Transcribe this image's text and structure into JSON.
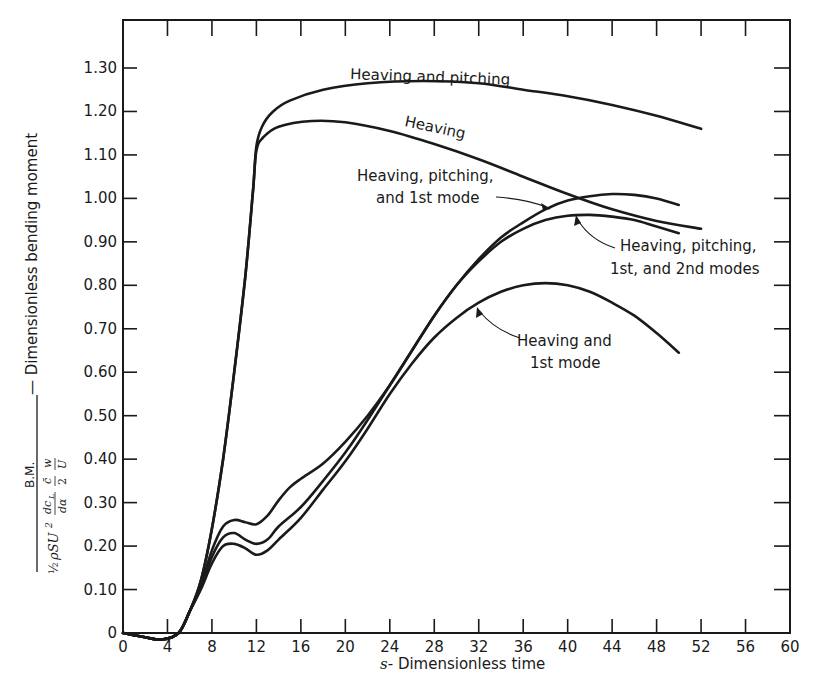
{
  "chart_data": {
    "type": "line",
    "title": "",
    "xlabel": "s - Dimensionless time",
    "xlabel_italic_prefix": "s",
    "xlabel_rest": "- Dimensionless time",
    "ylabel": "B.M. / (1/2 ρSU² (dc_L/dα) (c̄/2) (w/U)) — Dimensionless bending moment",
    "ylabel_parts": {
      "numerator": "B.M.",
      "denominator": "½ ρSU² (dcL/dα) (c̄/2) (w/U)",
      "suffix": "— Dimensionless bending moment"
    },
    "xlim": [
      0,
      60
    ],
    "ylim": [
      0,
      1.3
    ],
    "x_ticks": [
      "0",
      "4",
      "8",
      "12",
      "16",
      "20",
      "24",
      "28",
      "32",
      "36",
      "40",
      "44",
      "48",
      "52",
      "56",
      "60"
    ],
    "y_ticks": [
      "0",
      "0.10",
      "0.20",
      "0.30",
      "0.40",
      "0.50",
      "0.60",
      "0.70",
      "0.80",
      "0.90",
      "1.00",
      "1.10",
      "1.20",
      "1.30"
    ],
    "grid": false,
    "legend": "none (curves labeled directly)",
    "series": [
      {
        "name": "Heaving and pitching",
        "points": [
          [
            0,
            0
          ],
          [
            2,
            -0.01
          ],
          [
            3.5,
            -0.015
          ],
          [
            5,
            0.0
          ],
          [
            6,
            0.05
          ],
          [
            7,
            0.12
          ],
          [
            8,
            0.24
          ],
          [
            9,
            0.4
          ],
          [
            10,
            0.6
          ],
          [
            11,
            0.82
          ],
          [
            11.7,
            1.02
          ],
          [
            12,
            1.12
          ],
          [
            12.5,
            1.165
          ],
          [
            13.5,
            1.2
          ],
          [
            15,
            1.225
          ],
          [
            18,
            1.25
          ],
          [
            22,
            1.265
          ],
          [
            27,
            1.27
          ],
          [
            32,
            1.265
          ],
          [
            36,
            1.25
          ],
          [
            40,
            1.235
          ],
          [
            44,
            1.215
          ],
          [
            48,
            1.19
          ],
          [
            52,
            1.16
          ]
        ]
      },
      {
        "name": "Heaving",
        "points": [
          [
            0,
            0
          ],
          [
            2,
            -0.01
          ],
          [
            3.5,
            -0.015
          ],
          [
            5,
            0.0
          ],
          [
            6,
            0.05
          ],
          [
            7,
            0.12
          ],
          [
            8,
            0.24
          ],
          [
            9,
            0.4
          ],
          [
            10,
            0.6
          ],
          [
            11,
            0.82
          ],
          [
            11.7,
            1.02
          ],
          [
            12,
            1.11
          ],
          [
            12.6,
            1.14
          ],
          [
            14,
            1.165
          ],
          [
            17,
            1.178
          ],
          [
            20,
            1.175
          ],
          [
            24,
            1.155
          ],
          [
            28,
            1.125
          ],
          [
            32,
            1.09
          ],
          [
            36,
            1.05
          ],
          [
            40,
            1.01
          ],
          [
            44,
            0.975
          ],
          [
            48,
            0.948
          ],
          [
            52,
            0.93
          ]
        ]
      },
      {
        "name": "Heaving, pitching, and 1st mode",
        "points": [
          [
            0,
            0
          ],
          [
            2,
            -0.01
          ],
          [
            3.5,
            -0.015
          ],
          [
            5,
            0.0
          ],
          [
            6,
            0.05
          ],
          [
            7,
            0.11
          ],
          [
            8,
            0.19
          ],
          [
            9,
            0.245
          ],
          [
            10,
            0.26
          ],
          [
            11,
            0.255
          ],
          [
            12,
            0.25
          ],
          [
            13,
            0.27
          ],
          [
            14,
            0.305
          ],
          [
            15,
            0.335
          ],
          [
            16,
            0.355
          ],
          [
            18,
            0.39
          ],
          [
            20,
            0.44
          ],
          [
            22,
            0.5
          ],
          [
            24,
            0.57
          ],
          [
            26,
            0.65
          ],
          [
            28,
            0.73
          ],
          [
            30,
            0.8
          ],
          [
            32,
            0.86
          ],
          [
            34,
            0.91
          ],
          [
            36,
            0.945
          ],
          [
            38,
            0.975
          ],
          [
            40,
            0.995
          ],
          [
            42,
            1.005
          ],
          [
            44,
            1.01
          ],
          [
            46,
            1.008
          ],
          [
            48,
            1.0
          ],
          [
            50,
            0.985
          ]
        ]
      },
      {
        "name": "Heaving, pitching, 1st, and 2nd modes",
        "points": [
          [
            0,
            0
          ],
          [
            2,
            -0.01
          ],
          [
            3.5,
            -0.015
          ],
          [
            5,
            0.0
          ],
          [
            6,
            0.05
          ],
          [
            7,
            0.105
          ],
          [
            8,
            0.175
          ],
          [
            9,
            0.22
          ],
          [
            10,
            0.23
          ],
          [
            11,
            0.215
          ],
          [
            12,
            0.205
          ],
          [
            13,
            0.215
          ],
          [
            14,
            0.245
          ],
          [
            16,
            0.29
          ],
          [
            18,
            0.35
          ],
          [
            20,
            0.415
          ],
          [
            22,
            0.49
          ],
          [
            24,
            0.57
          ],
          [
            26,
            0.65
          ],
          [
            28,
            0.73
          ],
          [
            30,
            0.8
          ],
          [
            32,
            0.855
          ],
          [
            34,
            0.9
          ],
          [
            36,
            0.93
          ],
          [
            38,
            0.95
          ],
          [
            40,
            0.96
          ],
          [
            42,
            0.962
          ],
          [
            44,
            0.958
          ],
          [
            46,
            0.95
          ],
          [
            48,
            0.935
          ],
          [
            50,
            0.92
          ]
        ]
      },
      {
        "name": "Heaving and 1st mode",
        "points": [
          [
            0,
            0
          ],
          [
            2,
            -0.01
          ],
          [
            3.5,
            -0.015
          ],
          [
            5,
            0.0
          ],
          [
            6,
            0.05
          ],
          [
            7,
            0.1
          ],
          [
            8,
            0.16
          ],
          [
            9,
            0.2
          ],
          [
            10,
            0.205
          ],
          [
            11,
            0.195
          ],
          [
            12,
            0.18
          ],
          [
            13,
            0.19
          ],
          [
            14,
            0.215
          ],
          [
            16,
            0.265
          ],
          [
            18,
            0.33
          ],
          [
            20,
            0.395
          ],
          [
            22,
            0.47
          ],
          [
            24,
            0.55
          ],
          [
            26,
            0.62
          ],
          [
            28,
            0.68
          ],
          [
            30,
            0.725
          ],
          [
            32,
            0.76
          ],
          [
            34,
            0.785
          ],
          [
            36,
            0.8
          ],
          [
            38,
            0.805
          ],
          [
            40,
            0.8
          ],
          [
            42,
            0.785
          ],
          [
            44,
            0.76
          ],
          [
            46,
            0.73
          ],
          [
            48,
            0.69
          ],
          [
            50,
            0.645
          ]
        ]
      }
    ],
    "annotations": [
      {
        "text": "Heaving and pitching",
        "near_series": "Heaving and pitching"
      },
      {
        "text": "Heaving",
        "near_series": "Heaving"
      },
      {
        "text": "Heaving, pitching,",
        "line": 1,
        "near_series": "Heaving, pitching, and 1st mode"
      },
      {
        "text": "and 1st mode",
        "line": 2,
        "near_series": "Heaving, pitching, and 1st mode"
      },
      {
        "text": "Heaving, pitching,",
        "line": 1,
        "near_series": "Heaving, pitching, 1st, and 2nd modes"
      },
      {
        "text": "1st, and 2nd modes",
        "line": 2,
        "near_series": "Heaving, pitching, 1st, and 2nd modes"
      },
      {
        "text": "Heaving and",
        "line": 1,
        "near_series": "Heaving and 1st mode"
      },
      {
        "text": "1st mode",
        "line": 2,
        "near_series": "Heaving and 1st mode"
      }
    ]
  },
  "labels": {
    "hp": "Heaving and pitching",
    "h": "Heaving",
    "hp1_a": "Heaving, pitching,",
    "hp1_b": "and 1st mode",
    "hp12_a": "Heaving, pitching,",
    "hp12_b": "1st, and 2nd modes",
    "h1_a": "Heaving and",
    "h1_b": "1st mode",
    "x_title_s": "s",
    "x_title_rest": "- Dimensionless time",
    "y_num": "B.M.",
    "y_half": "½",
    "y_rho": "ρSU",
    "y_sq": "2",
    "y_dcl": "dc",
    "y_dcl_sub": "L",
    "y_da": "dα",
    "y_cbar": "c̄",
    "y_two": "2",
    "y_w": "w",
    "y_U": "U",
    "y_suffix": "— Dimensionless bending moment"
  },
  "colors": {
    "ink": "#1a1a1a",
    "background": "#ffffff"
  }
}
